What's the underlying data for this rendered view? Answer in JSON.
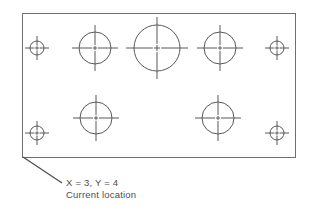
{
  "diagram": {
    "type": "technical-drawing",
    "canvas": {
      "width": 313,
      "height": 215
    },
    "colors": {
      "background": "#ffffff",
      "frame_stroke": "#6f6f72",
      "feature_stroke": "#58585b",
      "leader_stroke": "#4a4a4d",
      "text": "#4c4c4f"
    },
    "frame": {
      "name": "bed-outline",
      "x": 22,
      "y": 13,
      "width": 273,
      "height": 144
    },
    "features": [
      {
        "id": "target-top-left",
        "kind": "small-target",
        "cx": 37,
        "cy": 48,
        "r": 7,
        "crosshair_extent": 12
      },
      {
        "id": "circle-top-left",
        "kind": "medium-circle",
        "cx": 95,
        "cy": 48,
        "r": 16,
        "crosshair_extent": 23
      },
      {
        "id": "circle-top-center",
        "kind": "large-circle",
        "cx": 157,
        "cy": 48,
        "r": 23,
        "crosshair_extent": 31
      },
      {
        "id": "circle-top-right",
        "kind": "medium-circle",
        "cx": 220,
        "cy": 48,
        "r": 16,
        "crosshair_extent": 23
      },
      {
        "id": "target-top-right",
        "kind": "small-target",
        "cx": 277,
        "cy": 48,
        "r": 7,
        "crosshair_extent": 12
      },
      {
        "id": "target-bottom-left",
        "kind": "small-target",
        "cx": 37,
        "cy": 133,
        "r": 7,
        "crosshair_extent": 12
      },
      {
        "id": "circle-bottom-left",
        "kind": "medium-circle",
        "cx": 96,
        "cy": 118,
        "r": 16,
        "crosshair_extent": 23
      },
      {
        "id": "circle-bottom-right",
        "kind": "medium-circle",
        "cx": 218,
        "cy": 118,
        "r": 16,
        "crosshair_extent": 23
      },
      {
        "id": "target-bottom-right",
        "kind": "small-target",
        "cx": 277,
        "cy": 133,
        "r": 7,
        "crosshair_extent": 12
      }
    ],
    "leader": {
      "name": "callout-leader-line",
      "x1": 23,
      "y1": 157,
      "x2": 62,
      "y2": 183
    },
    "annotation": {
      "coordinate_label": "X = 3, Y = 4",
      "description_label": "Current location",
      "x_value": 3,
      "y_value": 4,
      "text_x": 66,
      "line1_y": 186,
      "line2_y": 198
    }
  }
}
